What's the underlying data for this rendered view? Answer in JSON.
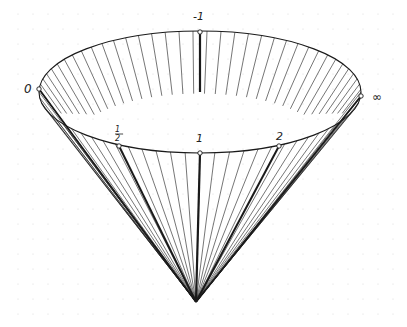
{
  "diagram": {
    "colors": {
      "ink": "#1a1a1a",
      "grid": "#d8d8d8",
      "background": "#ffffff"
    },
    "ellipse": {
      "cx": 200,
      "cy": 92,
      "rx": 161,
      "ry": 61
    },
    "apex": {
      "x": 196,
      "y": 302
    },
    "labels": {
      "top": "-1",
      "left": "0",
      "right": "∞",
      "half_num": "1",
      "half_den": "2",
      "one": "1",
      "two": "2"
    }
  }
}
